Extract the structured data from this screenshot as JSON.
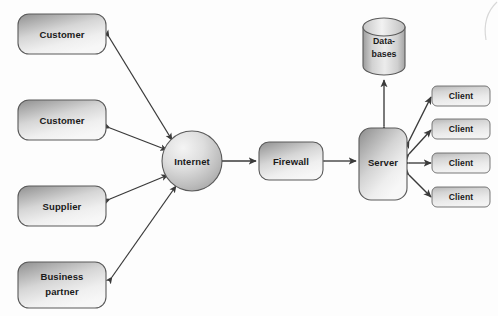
{
  "diagram": {
    "background_color": "#fdfdfd",
    "line_color": "#3a3a3a",
    "shape_border_color": "#5a5a5a",
    "shape_fill_light": "#f2f2f2",
    "shape_fill_dark": "#9a9a9a",
    "text_color": "#1a1a1a"
  },
  "external_nodes": [
    {
      "id": "customer-1",
      "label": "Customer",
      "shape": "rounded-rect"
    },
    {
      "id": "customer-2",
      "label": "Customer",
      "shape": "rounded-rect"
    },
    {
      "id": "supplier",
      "label": "Supplier",
      "shape": "rounded-rect"
    },
    {
      "id": "business-partner",
      "label_line1": "Business",
      "label_line2": "partner",
      "shape": "rounded-rect"
    }
  ],
  "network_nodes": {
    "internet": {
      "label": "Internet",
      "shape": "circle"
    },
    "firewall": {
      "label": "Firewall",
      "shape": "rounded-rect"
    },
    "server": {
      "label": "Server",
      "shape": "rounded-rect"
    },
    "databases": {
      "label_line1": "Data-",
      "label_line2": "bases",
      "shape": "cylinder"
    }
  },
  "client_nodes": [
    {
      "id": "client-1",
      "label": "Client",
      "shape": "rounded-rect"
    },
    {
      "id": "client-2",
      "label": "Client",
      "shape": "rounded-rect"
    },
    {
      "id": "client-3",
      "label": "Client",
      "shape": "rounded-rect"
    },
    {
      "id": "client-4",
      "label": "Client",
      "shape": "rounded-rect"
    }
  ],
  "connections": [
    {
      "from": "customer-1",
      "to": "internet",
      "arrow": "double"
    },
    {
      "from": "customer-2",
      "to": "internet",
      "arrow": "double"
    },
    {
      "from": "supplier",
      "to": "internet",
      "arrow": "double"
    },
    {
      "from": "business-partner",
      "to": "internet",
      "arrow": "double"
    },
    {
      "from": "internet",
      "to": "firewall",
      "arrow": "double"
    },
    {
      "from": "firewall",
      "to": "server",
      "arrow": "double"
    },
    {
      "from": "server",
      "to": "databases",
      "arrow": "double"
    },
    {
      "from": "server",
      "to": "client-1",
      "arrow": "double"
    },
    {
      "from": "server",
      "to": "client-2",
      "arrow": "double"
    },
    {
      "from": "server",
      "to": "client-3",
      "arrow": "double"
    },
    {
      "from": "server",
      "to": "client-4",
      "arrow": "double"
    }
  ]
}
